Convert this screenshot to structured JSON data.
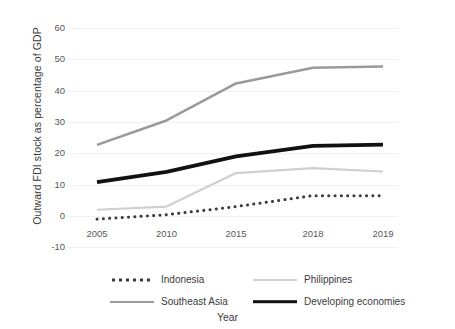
{
  "chart_data": {
    "type": "line",
    "title": "",
    "xlabel": "Year",
    "ylabel": "Outward FDI stock as percentage of GDP",
    "categories": [
      "2005",
      "2010",
      "2015",
      "2018",
      "2019"
    ],
    "x_tick_labels": [
      "2005",
      "2010",
      "2015",
      "2018",
      "2019"
    ],
    "y_tick_labels": [
      "60",
      "50",
      "40",
      "30",
      "20",
      "10",
      "0",
      "-10"
    ],
    "y_ticks": [
      60,
      50,
      40,
      30,
      20,
      10,
      0,
      -10
    ],
    "ylim": [
      -10,
      60
    ],
    "grid": true,
    "grid_axis": "y",
    "legend_position": "bottom",
    "series": [
      {
        "name": "Indonesia",
        "values": [
          -1,
          0.4,
          3,
          6.5,
          6.5
        ],
        "style": "dotted",
        "color": "#3a3a3a",
        "width": 3
      },
      {
        "name": "Philippines",
        "values": [
          2,
          3,
          13.7,
          15.3,
          14.2
        ],
        "style": "solid",
        "color": "#cfcfcf",
        "width": 2.2
      },
      {
        "name": "Southeast Asia",
        "values": [
          22.7,
          30.5,
          42.3,
          47.3,
          47.7
        ],
        "style": "solid",
        "color": "#9a9a9a",
        "width": 2.6
      },
      {
        "name": "Developing economies",
        "values": [
          10.8,
          14.1,
          19,
          22.4,
          22.8
        ],
        "style": "solid",
        "color": "#111111",
        "width": 3.8
      }
    ]
  },
  "legend": {
    "items": [
      {
        "label": "Indonesia",
        "swatch": "dotted-line-swatch"
      },
      {
        "label": "Philippines",
        "swatch": "light-gray-line-swatch"
      },
      {
        "label": "Southeast Asia",
        "swatch": "gray-line-swatch"
      },
      {
        "label": "Developing economies",
        "swatch": "black-thick-line-swatch"
      }
    ]
  }
}
